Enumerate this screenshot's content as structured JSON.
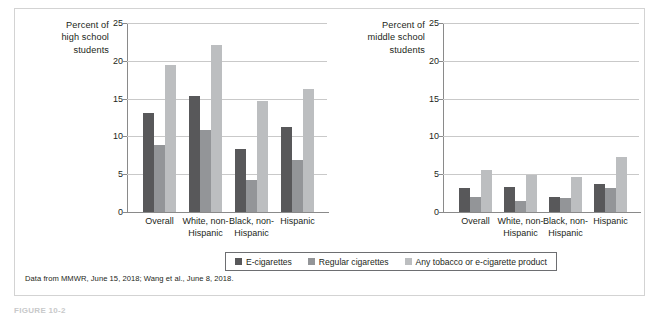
{
  "figure": {
    "caption": "FIGURE 10-2",
    "source_note": "Data from MMWR, June 15, 2018; Wang et al., June 8, 2018."
  },
  "legend": {
    "items": [
      {
        "label": "E-cigarettes",
        "color": "#58585a",
        "swatch_name": "legend-swatch-e-cigarettes"
      },
      {
        "label": "Regular cigarettes",
        "color": "#939598",
        "swatch_name": "legend-swatch-regular-cigarettes"
      },
      {
        "label": "Any tobacco or e-cigarette product",
        "color": "#bcbec0",
        "swatch_name": "legend-swatch-any-tobacco"
      }
    ]
  },
  "chart_data": [
    {
      "type": "bar",
      "title": "Percent of high school students",
      "ylabel": "Percent of high school students",
      "xlabel": "",
      "categories": [
        "Overall",
        "White, non-Hispanic",
        "Black, non-Hispanic",
        "Hispanic"
      ],
      "series": [
        {
          "name": "E-cigarettes",
          "color": "#58585a",
          "values": [
            13.1,
            15.4,
            8.3,
            11.2
          ]
        },
        {
          "name": "Regular cigarettes",
          "color": "#939598",
          "values": [
            8.8,
            10.9,
            4.2,
            6.9
          ]
        },
        {
          "name": "Any tobacco or e-cigarette product",
          "color": "#bcbec0",
          "values": [
            19.4,
            22.1,
            14.7,
            16.3
          ]
        }
      ],
      "ylim": [
        0,
        25
      ],
      "yticks": [
        0,
        5,
        10,
        15,
        20,
        25
      ],
      "grid": true,
      "legend_position": "bottom"
    },
    {
      "type": "bar",
      "title": "Percent of middle school students",
      "ylabel": "Percent of middle school students",
      "xlabel": "",
      "categories": [
        "Overall",
        "White, non-Hispanic",
        "Black, non-Hispanic",
        "Hispanic"
      ],
      "series": [
        {
          "name": "E-cigarettes",
          "color": "#58585a",
          "values": [
            3.2,
            3.3,
            2.0,
            3.7
          ]
        },
        {
          "name": "Regular cigarettes",
          "color": "#939598",
          "values": [
            2.0,
            1.5,
            1.8,
            3.2
          ]
        },
        {
          "name": "Any tobacco or e-cigarette product",
          "color": "#bcbec0",
          "values": [
            5.5,
            4.9,
            4.6,
            7.3
          ]
        }
      ],
      "ylim": [
        0,
        25
      ],
      "yticks": [
        0,
        5,
        10,
        15,
        20,
        25
      ],
      "grid": true,
      "legend_position": "bottom"
    }
  ],
  "charts": [
    {
      "axis_title_lines": [
        "Percent of",
        "high school",
        "students"
      ],
      "ytick_labels": [
        "25",
        "20",
        "15",
        "10",
        "5",
        "0"
      ],
      "xtick_labels": [
        [
          "Overall"
        ],
        [
          "White, non-",
          "Hispanic"
        ],
        [
          "Black, non-",
          "Hispanic"
        ],
        [
          "Hispanic"
        ]
      ]
    },
    {
      "axis_title_lines": [
        "Percent of",
        "middle school",
        "students"
      ],
      "ytick_labels": [
        "25",
        "20",
        "15",
        "10",
        "5",
        "0"
      ],
      "xtick_labels": [
        [
          "Overall"
        ],
        [
          "White, non-",
          "Hispanic"
        ],
        [
          "Black, non-",
          "Hispanic"
        ],
        [
          "Hispanic"
        ]
      ]
    }
  ]
}
